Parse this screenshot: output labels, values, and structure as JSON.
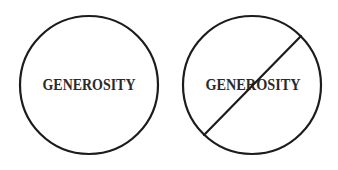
{
  "figure": {
    "left": {
      "label": "GENEROSITY",
      "crossed_out": false
    },
    "right": {
      "label": "GENEROSITY",
      "crossed_out": true
    },
    "colors": {
      "stroke": "#1c1c1c",
      "text": "#2a2a2a",
      "background": "#ffffff"
    }
  }
}
